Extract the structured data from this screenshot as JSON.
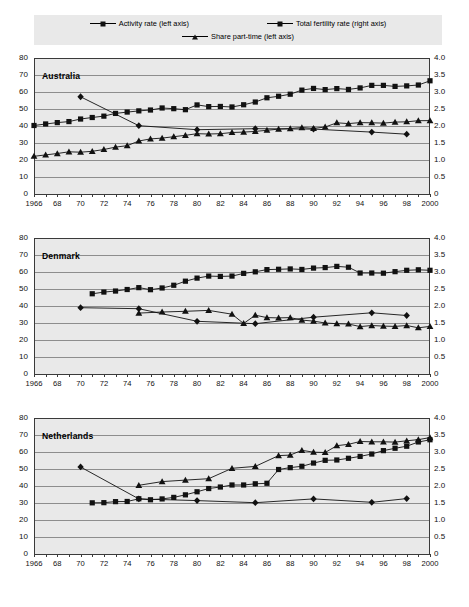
{
  "legend": {
    "items": [
      {
        "label": "Activity rate (left axis)",
        "marker": "square-marker"
      },
      {
        "label": "Total fertility rate (right axis)",
        "marker": "diamond-marker"
      },
      {
        "label": "Share part-time (left axis)",
        "marker": "triangle-marker"
      }
    ]
  },
  "axes": {
    "left_ticks": [
      "80",
      "70",
      "60",
      "50",
      "40",
      "30",
      "20",
      "10",
      "0"
    ],
    "right_ticks": [
      "4.0",
      "3.5",
      "3.0",
      "2.5",
      "2.0",
      "1.5",
      "1.0",
      "0.5",
      "0"
    ],
    "x_ticks": [
      "1966",
      "68",
      "70",
      "72",
      "74",
      "76",
      "78",
      "80",
      "82",
      "84",
      "86",
      "88",
      "90",
      "92",
      "94",
      "96",
      "98",
      "2000"
    ],
    "left_range": [
      0,
      80
    ],
    "right_range": [
      0,
      4.0
    ],
    "x_range": [
      1966,
      2000
    ]
  },
  "chart_data": [
    {
      "type": "line",
      "title": "Australia",
      "xlabel": "",
      "ylabel": "",
      "ylim": [
        0,
        80
      ],
      "y2lim": [
        0,
        4.0
      ],
      "xlim": [
        1966,
        2000
      ],
      "grid": true,
      "legend_position": "top",
      "x": [
        1966,
        1967,
        1968,
        1969,
        1970,
        1971,
        1972,
        1973,
        1974,
        1975,
        1976,
        1977,
        1978,
        1979,
        1980,
        1981,
        1982,
        1983,
        1984,
        1985,
        1986,
        1987,
        1988,
        1989,
        1990,
        1991,
        1992,
        1993,
        1994,
        1995,
        1996,
        1997,
        1998,
        1999,
        2000
      ],
      "series": [
        {
          "name": "Activity rate (left axis)",
          "axis": "left",
          "marker": "square-marker",
          "x": [
            1966,
            1967,
            1968,
            1969,
            1970,
            1971,
            1972,
            1973,
            1974,
            1975,
            1976,
            1977,
            1978,
            1979,
            1980,
            1981,
            1982,
            1983,
            1984,
            1985,
            1986,
            1987,
            1988,
            1989,
            1990,
            1991,
            1992,
            1993,
            1994,
            1995,
            1996,
            1997,
            1998,
            1999,
            2000
          ],
          "values": [
            40.3,
            41.2,
            42.0,
            42.6,
            44.1,
            45.0,
            45.8,
            47.4,
            48.2,
            48.9,
            49.4,
            50.6,
            50.2,
            49.6,
            52.4,
            51.4,
            51.5,
            51.2,
            52.5,
            54.1,
            56.6,
            57.5,
            58.7,
            61.1,
            62.1,
            61.4,
            62.0,
            61.5,
            62.4,
            63.9,
            63.9,
            63.3,
            63.6,
            64.1,
            66.6
          ]
        },
        {
          "name": "Total fertility rate (right axis)",
          "axis": "right",
          "marker": "diamond-marker",
          "x": [
            1970,
            1975,
            1980,
            1985,
            1990,
            1995,
            1998
          ],
          "values": [
            2.86,
            2.01,
            1.89,
            1.92,
            1.91,
            1.82,
            1.76
          ]
        },
        {
          "name": "Share part-time (left axis)",
          "axis": "left",
          "marker": "triangle-marker",
          "x": [
            1966,
            1967,
            1968,
            1969,
            1970,
            1971,
            1972,
            1973,
            1974,
            1975,
            1976,
            1977,
            1978,
            1979,
            1980,
            1981,
            1982,
            1983,
            1984,
            1985,
            1986,
            1987,
            1988,
            1989,
            1990,
            1991,
            1992,
            1993,
            1994,
            1995,
            1996,
            1997,
            1998,
            1999,
            2000
          ],
          "values": [
            22.2,
            23.0,
            23.8,
            24.8,
            24.6,
            25.1,
            26.2,
            27.6,
            28.4,
            31.2,
            32.4,
            32.9,
            33.7,
            34.5,
            35.5,
            35.3,
            35.5,
            36.2,
            36.4,
            36.8,
            37.5,
            38.2,
            38.5,
            39.1,
            38.6,
            39.4,
            41.9,
            41.4,
            42.0,
            41.9,
            41.7,
            42.3,
            42.5,
            43.1,
            43.2
          ]
        }
      ]
    },
    {
      "type": "line",
      "title": "Denmark",
      "xlabel": "",
      "ylabel": "",
      "ylim": [
        0,
        80
      ],
      "y2lim": [
        0,
        4.0
      ],
      "xlim": [
        1966,
        2000
      ],
      "grid": true,
      "legend_position": "top",
      "x": [
        1971,
        1972,
        1973,
        1974,
        1975,
        1976,
        1977,
        1978,
        1979,
        1980,
        1981,
        1982,
        1983,
        1984,
        1985,
        1986,
        1987,
        1988,
        1989,
        1990,
        1991,
        1992,
        1993,
        1994,
        1995,
        1996,
        1997,
        1998,
        1999,
        2000
      ],
      "series": [
        {
          "name": "Activity rate (left axis)",
          "axis": "left",
          "marker": "square-marker",
          "x": [
            1971,
            1972,
            1973,
            1974,
            1975,
            1976,
            1977,
            1978,
            1979,
            1980,
            1981,
            1982,
            1983,
            1984,
            1985,
            1986,
            1987,
            1988,
            1989,
            1990,
            1991,
            1992,
            1993,
            1994,
            1995,
            1996,
            1997,
            1998,
            1999,
            2000
          ],
          "values": [
            47.2,
            48.2,
            48.8,
            49.7,
            50.8,
            49.6,
            50.6,
            52.2,
            54.6,
            56.4,
            57.6,
            57.4,
            57.6,
            59.2,
            60.1,
            61.4,
            61.6,
            61.8,
            61.5,
            62.3,
            62.6,
            63.3,
            62.8,
            59.4,
            59.4,
            59.3,
            60.2,
            61.0,
            61.3,
            61.0
          ]
        },
        {
          "name": "Total fertility rate (right axis)",
          "axis": "right",
          "marker": "diamond-marker",
          "x": [
            1970,
            1975,
            1980,
            1985,
            1990,
            1995,
            1998
          ],
          "values": [
            1.95,
            1.92,
            1.55,
            1.48,
            1.67,
            1.8,
            1.72
          ]
        },
        {
          "name": "Share part-time (left axis)",
          "axis": "left",
          "marker": "triangle-marker",
          "x": [
            1975,
            1977,
            1979,
            1981,
            1983,
            1984,
            1985,
            1986,
            1987,
            1988,
            1989,
            1990,
            1991,
            1992,
            1993,
            1994,
            1995,
            1996,
            1997,
            1998,
            1999,
            2000
          ],
          "values": [
            35.8,
            36.5,
            36.9,
            37.4,
            35.2,
            29.7,
            34.6,
            33.2,
            33.0,
            33.2,
            31.7,
            31.1,
            30.0,
            29.6,
            29.4,
            27.9,
            28.5,
            28.2,
            28.0,
            28.5,
            27.2,
            28.0
          ]
        }
      ]
    },
    {
      "type": "line",
      "title": "Netherlands",
      "xlabel": "",
      "ylabel": "",
      "ylim": [
        0,
        80
      ],
      "y2lim": [
        0,
        4.0
      ],
      "xlim": [
        1966,
        2000
      ],
      "grid": true,
      "legend_position": "top",
      "x": [
        1971,
        1972,
        1973,
        1974,
        1975,
        1976,
        1977,
        1978,
        1979,
        1980,
        1981,
        1982,
        1983,
        1984,
        1985,
        1986,
        1987,
        1988,
        1989,
        1990,
        1991,
        1992,
        1993,
        1994,
        1995,
        1996,
        1997,
        1998,
        1999,
        2000
      ],
      "series": [
        {
          "name": "Activity rate (left axis)",
          "axis": "left",
          "marker": "square-marker",
          "x": [
            1971,
            1972,
            1973,
            1974,
            1975,
            1976,
            1977,
            1978,
            1979,
            1980,
            1981,
            1982,
            1983,
            1984,
            1985,
            1986,
            1987,
            1988,
            1989,
            1990,
            1991,
            1992,
            1993,
            1994,
            1995,
            1996,
            1997,
            1998,
            1999,
            2000
          ],
          "values": [
            30.1,
            30.2,
            30.8,
            30.9,
            32.5,
            31.9,
            32.4,
            33.3,
            34.8,
            36.6,
            38.5,
            39.4,
            40.6,
            40.6,
            41.3,
            41.6,
            49.7,
            50.8,
            51.6,
            53.5,
            55.1,
            55.3,
            56.3,
            57.4,
            58.8,
            60.8,
            62.2,
            63.4,
            65.9,
            67.2
          ]
        },
        {
          "name": "Total fertility rate (right axis)",
          "axis": "right",
          "marker": "diamond-marker",
          "x": [
            1970,
            1975,
            1980,
            1985,
            1990,
            1995,
            1998
          ],
          "values": [
            2.56,
            1.62,
            1.57,
            1.51,
            1.62,
            1.52,
            1.63
          ]
        },
        {
          "name": "Share part-time (left axis)",
          "axis": "left",
          "marker": "triangle-marker",
          "x": [
            1975,
            1977,
            1979,
            1981,
            1983,
            1985,
            1987,
            1988,
            1989,
            1990,
            1991,
            1992,
            1993,
            1994,
            1995,
            1996,
            1997,
            1998,
            1999,
            2000
          ],
          "values": [
            40.4,
            42.6,
            43.5,
            44.3,
            50.4,
            51.5,
            57.9,
            58.2,
            61.0,
            59.9,
            59.7,
            63.7,
            64.5,
            66.2,
            66.0,
            66.0,
            65.8,
            66.6,
            67.3,
            68.5
          ]
        }
      ]
    }
  ],
  "colors": {
    "panel_background": "#e9e9e9",
    "grid": "#8d8d8d",
    "axis": "#3a3a3a",
    "series": "#111111",
    "page_background": "#ffffff"
  }
}
